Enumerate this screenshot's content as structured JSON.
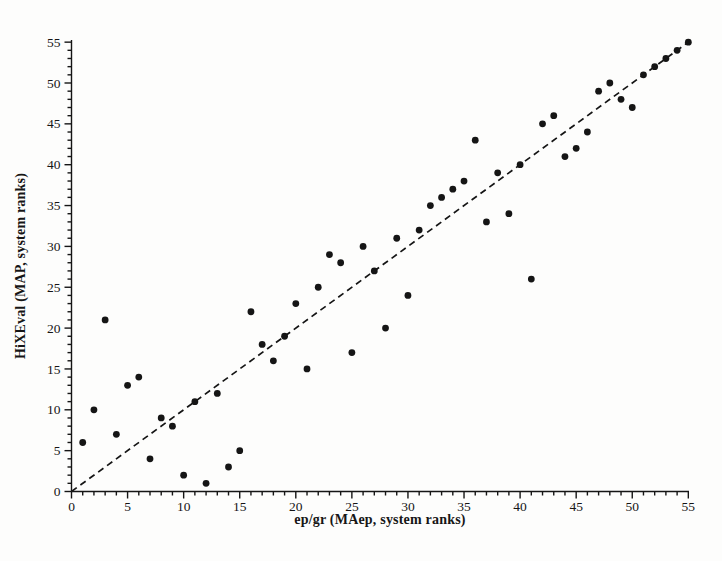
{
  "figure": {
    "background": "#fdfdfc",
    "ink": "#151515"
  },
  "chart_data": {
    "type": "scatter",
    "title": "",
    "xlabel": "ep/gr (MAep, system ranks)",
    "ylabel": "HiXEval (MAP, system ranks)",
    "xlim": [
      0,
      55
    ],
    "ylim": [
      0,
      55
    ],
    "xticks_major": [
      0,
      5,
      10,
      15,
      20,
      25,
      30,
      35,
      40,
      45,
      50,
      55
    ],
    "yticks_major": [
      0,
      5,
      10,
      15,
      20,
      25,
      30,
      35,
      40,
      45,
      50,
      55
    ],
    "minor_tick_step": 1,
    "grid": false,
    "legend": null,
    "marker": {
      "shape": "circle",
      "color": "#151515",
      "radius": 3.4
    },
    "reference_line": {
      "style": "dashed",
      "color": "#151515",
      "from": [
        0,
        0
      ],
      "to": [
        55,
        55
      ],
      "description": "identity diagonal y = x"
    },
    "points": [
      [
        1,
        6
      ],
      [
        2,
        10
      ],
      [
        3,
        21
      ],
      [
        4,
        7
      ],
      [
        5,
        13
      ],
      [
        6,
        14
      ],
      [
        7,
        4
      ],
      [
        8,
        9
      ],
      [
        9,
        8
      ],
      [
        10,
        2
      ],
      [
        11,
        11
      ],
      [
        12,
        1
      ],
      [
        13,
        12
      ],
      [
        14,
        3
      ],
      [
        15,
        5
      ],
      [
        16,
        22
      ],
      [
        17,
        18
      ],
      [
        18,
        16
      ],
      [
        19,
        19
      ],
      [
        20,
        23
      ],
      [
        21,
        15
      ],
      [
        22,
        25
      ],
      [
        23,
        29
      ],
      [
        24,
        28
      ],
      [
        25,
        17
      ],
      [
        26,
        30
      ],
      [
        27,
        27
      ],
      [
        28,
        20
      ],
      [
        29,
        31
      ],
      [
        30,
        24
      ],
      [
        31,
        32
      ],
      [
        32,
        35
      ],
      [
        33,
        36
      ],
      [
        34,
        37
      ],
      [
        35,
        38
      ],
      [
        36,
        43
      ],
      [
        37,
        33
      ],
      [
        38,
        39
      ],
      [
        39,
        34
      ],
      [
        40,
        40
      ],
      [
        41,
        26
      ],
      [
        42,
        45
      ],
      [
        43,
        46
      ],
      [
        44,
        41
      ],
      [
        45,
        42
      ],
      [
        46,
        44
      ],
      [
        47,
        49
      ],
      [
        48,
        50
      ],
      [
        49,
        48
      ],
      [
        50,
        47
      ],
      [
        51,
        51
      ],
      [
        52,
        52
      ],
      [
        53,
        53
      ],
      [
        54,
        54
      ],
      [
        55,
        55
      ]
    ]
  }
}
